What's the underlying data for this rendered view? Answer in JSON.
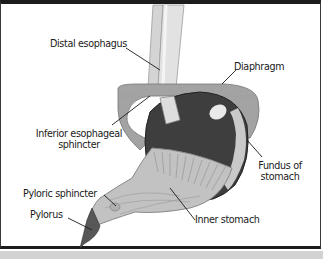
{
  "diagram": {
    "type": "anatomical-illustration",
    "subject": "stomach",
    "labels": {
      "distal_esophagus": "Distal esophagus",
      "diaphragm": "Diaphragm",
      "inferior_esophageal_sphincter_line1": "Inferior esophageal",
      "inferior_esophageal_sphincter_line2": "sphincter",
      "fundus_line1": "Fundus of",
      "fundus_line2": "stomach",
      "pyloric_sphincter": "Pyloric sphincter",
      "pylorus": "Pylorus",
      "inner_stomach": "Inner stomach"
    },
    "colors": {
      "frame_border": "#1c1c1c",
      "diaphragm": "#9a9a9a",
      "esophagus": "#d6d6d6",
      "stomach_dark": "#3c3c3c",
      "stomach_inner": "#bdbdbd",
      "pylorus": "#555555",
      "leader_line": "#1a1a1a"
    }
  }
}
